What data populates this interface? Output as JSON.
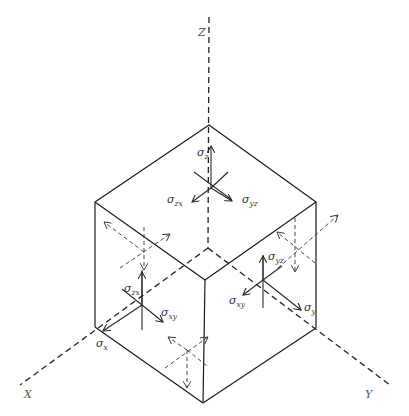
{
  "diagram": {
    "type": "stress-element-cube",
    "axes": {
      "z": {
        "label": "Z"
      },
      "x": {
        "label": "X"
      },
      "y": {
        "label": "Y"
      }
    },
    "top_face": {
      "normal": {
        "symbol": "σ",
        "sub": "z"
      },
      "shear_1": {
        "symbol": "σ",
        "sub": "zx"
      },
      "shear_2": {
        "symbol": "σ",
        "sub": "yz"
      }
    },
    "left_face": {
      "normal": {
        "symbol": "σ",
        "sub": "x"
      },
      "shear_1": {
        "symbol": "σ",
        "sub": "zx"
      },
      "shear_2": {
        "symbol": "σ",
        "sub": "xy"
      }
    },
    "right_face": {
      "normal": {
        "symbol": "σ",
        "sub": "y"
      },
      "shear_1": {
        "symbol": "σ",
        "sub": "yz"
      },
      "shear_2": {
        "symbol": "σ",
        "sub": "xy"
      }
    },
    "colors": {
      "edge": "#1a1a1a",
      "axis": "#222222",
      "label": "#333333",
      "background": "#ffffff"
    }
  }
}
